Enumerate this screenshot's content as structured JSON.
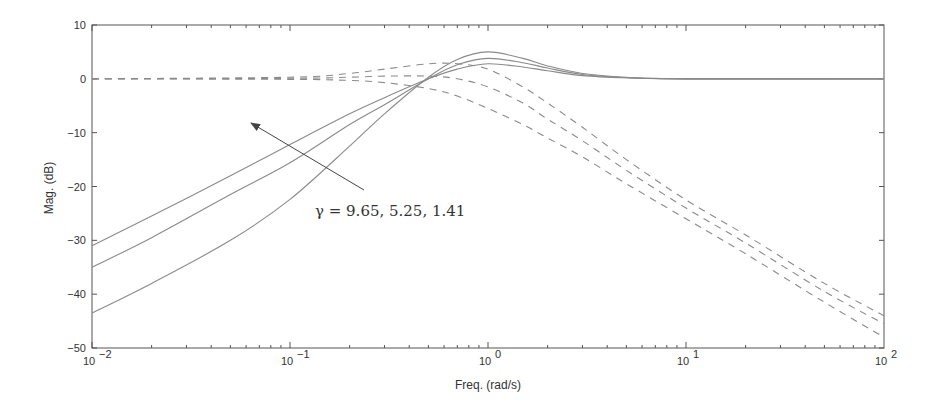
{
  "chart_data": {
    "type": "line",
    "title": "",
    "xlabel": "Freq. (rad/s)",
    "ylabel": "Mag. (dB)",
    "xscale": "log",
    "xlim": [
      0.01,
      100
    ],
    "ylim": [
      -50,
      10
    ],
    "grid": false,
    "xticks": [
      0.01,
      0.1,
      1,
      10,
      100
    ],
    "xtick_labels": [
      {
        "base": "10",
        "exp": "-2"
      },
      {
        "base": "10",
        "exp": "-1"
      },
      {
        "base": "10",
        "exp": "0"
      },
      {
        "base": "10",
        "exp": "1"
      },
      {
        "base": "10",
        "exp": "2"
      }
    ],
    "yticks": [
      10,
      0,
      -10,
      -20,
      -30,
      -40,
      -50
    ],
    "ytick_labels": [
      "10",
      "0",
      "−10",
      "−20",
      "−30",
      "−40",
      "−50"
    ],
    "annotation": {
      "text": "γ = 9.65, 5.25, 1.41",
      "arrow_from_px": [
        364,
        190
      ],
      "arrow_to_px": [
        251,
        123
      ],
      "text_px": [
        315,
        216
      ]
    },
    "series": [
      {
        "name": "solid gamma=9.65",
        "style": "solid",
        "x": [
          0.01,
          0.02,
          0.05,
          0.1,
          0.2,
          0.3,
          0.5,
          0.7,
          1.0,
          1.5,
          2,
          3,
          5,
          10,
          100
        ],
        "y": [
          -31,
          -25.5,
          -18,
          -12.2,
          -6.5,
          -3.5,
          0,
          1.8,
          2.8,
          2.2,
          1.5,
          0.6,
          0.2,
          0,
          0
        ]
      },
      {
        "name": "solid gamma=5.25",
        "style": "solid",
        "x": [
          0.01,
          0.02,
          0.05,
          0.1,
          0.2,
          0.3,
          0.5,
          0.7,
          1.0,
          1.5,
          2,
          3,
          5,
          10,
          100
        ],
        "y": [
          -35,
          -29.5,
          -21.5,
          -15.6,
          -8.5,
          -4.8,
          0,
          2.6,
          3.8,
          3.0,
          2.0,
          0.8,
          0.2,
          0,
          0
        ]
      },
      {
        "name": "solid gamma=1.41",
        "style": "solid",
        "x": [
          0.01,
          0.02,
          0.05,
          0.1,
          0.2,
          0.3,
          0.5,
          0.7,
          1.0,
          1.5,
          2,
          3,
          5,
          10,
          100
        ],
        "y": [
          -43.5,
          -38,
          -30,
          -22.4,
          -12.5,
          -6.5,
          0.3,
          3.6,
          5.0,
          3.8,
          2.4,
          1.0,
          0.3,
          0,
          0
        ]
      },
      {
        "name": "dashed gamma=9.65",
        "style": "dashed",
        "x": [
          0.01,
          0.1,
          0.2,
          0.3,
          0.5,
          0.7,
          1.0,
          1.5,
          2,
          3,
          5,
          10,
          20,
          50,
          100
        ],
        "y": [
          0,
          0.3,
          1.0,
          1.8,
          2.8,
          2.8,
          1.8,
          -1.5,
          -4.5,
          -9,
          -15,
          -22.5,
          -29,
          -38,
          -44
        ]
      },
      {
        "name": "dashed gamma=5.25",
        "style": "dashed",
        "x": [
          0.01,
          0.1,
          0.2,
          0.3,
          0.5,
          0.7,
          1.0,
          1.5,
          2,
          3,
          5,
          10,
          20,
          50,
          100
        ],
        "y": [
          0,
          0.1,
          0.3,
          0.5,
          0.5,
          0,
          -1.5,
          -4.5,
          -7.5,
          -11.5,
          -17,
          -24,
          -30.5,
          -39.5,
          -45.5
        ]
      },
      {
        "name": "dashed gamma=1.41",
        "style": "dashed",
        "x": [
          0.01,
          0.1,
          0.2,
          0.3,
          0.5,
          0.7,
          1.0,
          1.5,
          2,
          3,
          5,
          10,
          20,
          50,
          100
        ],
        "y": [
          0,
          -0.1,
          -0.3,
          -0.7,
          -1.8,
          -3.2,
          -5.5,
          -8.5,
          -11,
          -14.5,
          -19.5,
          -26,
          -32.5,
          -41.5,
          -48
        ]
      }
    ]
  },
  "axes": {
    "xlabel": "Freq. (rad/s)",
    "ylabel": "Mag. (dB)"
  },
  "annotation_text": "γ = 9.65, 5.25, 1.41"
}
